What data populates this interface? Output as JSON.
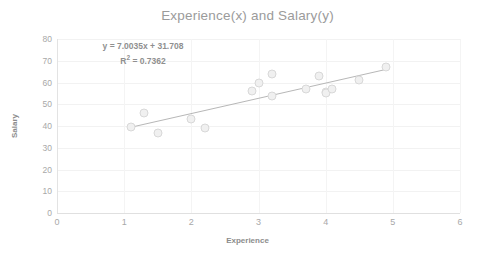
{
  "chart_data": {
    "type": "scatter",
    "title": "Experience(x) and Salary(y)",
    "xlabel": "Experience",
    "ylabel": "Salary",
    "xlim": [
      0,
      6
    ],
    "ylim": [
      0,
      80
    ],
    "xticks": [
      "0",
      "1",
      "2",
      "3",
      "4",
      "5",
      "6"
    ],
    "yticks": [
      "0",
      "10",
      "20",
      "30",
      "40",
      "50",
      "60",
      "70",
      "80"
    ],
    "grid": true,
    "legend": "none",
    "marker_color": "#f0f0f0",
    "marker_edge_color": "#d8d8d8",
    "trendline_color": "#b7b7b7",
    "annotations": {
      "equation": "y = 7.0035x + 31.708",
      "r_squared_label": "R",
      "r_squared_sup": "2",
      "r_squared_value": " = 0.7362"
    },
    "trendline": {
      "slope": 7.0035,
      "intercept": 31.708,
      "r_squared": 0.7362,
      "x_start": 1.1,
      "x_end": 4.9
    },
    "points": [
      {
        "x": 1.1,
        "y": 39.5
      },
      {
        "x": 1.3,
        "y": 46.0
      },
      {
        "x": 1.5,
        "y": 37.0
      },
      {
        "x": 2.0,
        "y": 43.0
      },
      {
        "x": 2.2,
        "y": 39.3
      },
      {
        "x": 2.9,
        "y": 56.0
      },
      {
        "x": 3.0,
        "y": 60.0
      },
      {
        "x": 3.2,
        "y": 64.0
      },
      {
        "x": 3.2,
        "y": 54.0
      },
      {
        "x": 3.7,
        "y": 57.0
      },
      {
        "x": 3.9,
        "y": 63.0
      },
      {
        "x": 4.0,
        "y": 55.5
      },
      {
        "x": 4.0,
        "y": 55.0
      },
      {
        "x": 4.1,
        "y": 57.0
      },
      {
        "x": 4.5,
        "y": 61.0
      },
      {
        "x": 4.9,
        "y": 67.0
      }
    ]
  }
}
